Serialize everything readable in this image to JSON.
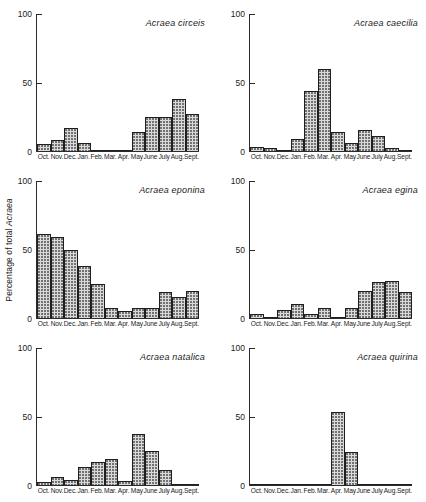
{
  "axes": {
    "ylabel_prefix": "Percentage of total ",
    "ylabel_italic": "Acraea",
    "ytick_100": "100",
    "ytick_50": "50",
    "ytick_0": "0",
    "months": [
      "Oct.",
      "Nov.",
      "Dec.",
      "Jan.",
      "Feb.",
      "Mar.",
      "Apr.",
      "May",
      "June",
      "July",
      "Aug.",
      "Sept."
    ]
  },
  "style": {
    "bar_fill": "#d9d9d9",
    "bar_dot": "#6e6e6e",
    "bar_outline": "#1f1f1f",
    "axis_color": "#2b2b2b",
    "background": "#ffffff"
  },
  "chart_data": [
    {
      "type": "bar",
      "title": "Acraea circeis",
      "xlabel": "",
      "ylabel": "Percentage of total Acraea",
      "ylim": [
        0,
        100
      ],
      "yticks": [
        0,
        50,
        100
      ],
      "grid": false,
      "legend": "none",
      "categories": [
        "Oct.",
        "Nov.",
        "Dec.",
        "Jan.",
        "Feb.",
        "Mar.",
        "Apr.",
        "May",
        "June",
        "July",
        "Aug.",
        "Sept."
      ],
      "values": [
        5,
        8,
        17,
        6,
        0,
        0,
        1,
        14,
        25,
        25,
        38,
        27
      ]
    },
    {
      "type": "bar",
      "title": "Acraea caecilia",
      "xlabel": "",
      "ylabel": "Percentage of total Acraea",
      "ylim": [
        0,
        100
      ],
      "yticks": [
        0,
        50,
        100
      ],
      "grid": false,
      "legend": "none",
      "categories": [
        "Oct.",
        "Nov.",
        "Dec.",
        "Jan.",
        "Feb.",
        "Mar.",
        "Apr.",
        "May",
        "June",
        "July",
        "Aug.",
        "Sept."
      ],
      "values": [
        3,
        2,
        0,
        9,
        44,
        60,
        14,
        6,
        15,
        11,
        2,
        1
      ]
    },
    {
      "type": "bar",
      "title": "Acraea eponina",
      "xlabel": "",
      "ylabel": "Percentage of total Acraea",
      "ylim": [
        0,
        100
      ],
      "yticks": [
        0,
        50,
        100
      ],
      "grid": false,
      "legend": "none",
      "categories": [
        "Oct.",
        "Nov.",
        "Dec.",
        "Jan.",
        "Feb.",
        "Mar.",
        "Apr.",
        "May",
        "June",
        "July",
        "Aug.",
        "Sept."
      ],
      "values": [
        61,
        59,
        50,
        38,
        25,
        7,
        5,
        7,
        7,
        19,
        15,
        20
      ]
    },
    {
      "type": "bar",
      "title": "Acraea egina",
      "xlabel": "",
      "ylabel": "Percentage of total Acraea",
      "ylim": [
        0,
        100
      ],
      "yticks": [
        0,
        50,
        100
      ],
      "grid": false,
      "legend": "none",
      "categories": [
        "Oct.",
        "Nov.",
        "Dec.",
        "Jan.",
        "Feb.",
        "Mar.",
        "Apr.",
        "May",
        "June",
        "July",
        "Aug.",
        "Sept."
      ],
      "values": [
        3,
        1,
        6,
        10,
        3,
        7,
        1,
        7,
        20,
        26,
        27,
        19
      ]
    },
    {
      "type": "bar",
      "title": "Acraea natalica",
      "xlabel": "",
      "ylabel": "Percentage of total Acraea",
      "ylim": [
        0,
        100
      ],
      "yticks": [
        0,
        50,
        100
      ],
      "grid": false,
      "legend": "none",
      "categories": [
        "Oct.",
        "Nov.",
        "Dec.",
        "Jan.",
        "Feb.",
        "Mar.",
        "Apr.",
        "May",
        "June",
        "July",
        "Aug.",
        "Sept."
      ],
      "values": [
        2,
        6,
        4,
        13,
        17,
        19,
        3,
        37,
        25,
        11,
        1,
        0
      ]
    },
    {
      "type": "bar",
      "title": "Acraea quirina",
      "xlabel": "",
      "ylabel": "Percentage of total Acraea",
      "ylim": [
        0,
        100
      ],
      "yticks": [
        0,
        50,
        100
      ],
      "grid": false,
      "legend": "none",
      "categories": [
        "Oct.",
        "Nov.",
        "Dec.",
        "Jan.",
        "Feb.",
        "Mar.",
        "Apr.",
        "May",
        "June",
        "July",
        "Aug.",
        "Sept."
      ],
      "values": [
        0,
        0,
        1,
        0,
        0,
        0,
        53,
        24,
        0,
        0,
        0,
        0
      ]
    }
  ]
}
